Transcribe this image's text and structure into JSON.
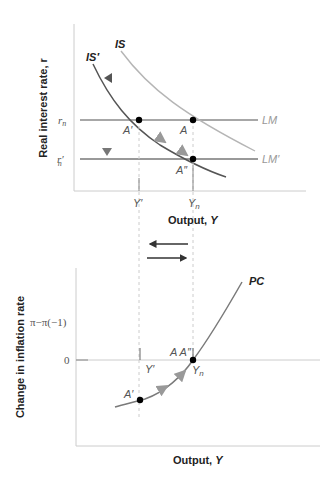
{
  "top_panel": {
    "ylabel": "Real interest rate, r",
    "xlabel_text": "Output, ",
    "xlabel_var": "Y",
    "curves": {
      "is": "IS",
      "is_prime": "IS′",
      "lm": "LM",
      "lm_prime": "LM′"
    },
    "y_ticks": {
      "rn": "r",
      "rn_sub": "n",
      "rn_prime": "r′",
      "rn_prime_sub": "n"
    },
    "x_ticks": {
      "y_prime": "Y′",
      "yn": "Y",
      "yn_sub": "n"
    },
    "points": {
      "a_prime": "A′",
      "a": "A",
      "a_dprime": "A″"
    }
  },
  "bottom_panel": {
    "ylabel": "Change in inflation rate",
    "xlabel_text": "Output, ",
    "xlabel_var": "Y",
    "curves": {
      "pc": "PC"
    },
    "y_ticks": {
      "pi": "π−π(−1)",
      "zero": "0"
    },
    "x_ticks": {
      "y_prime": "Y′",
      "yn": "Y",
      "yn_sub": "n"
    },
    "points": {
      "a_prime": "A′",
      "a_a_dprime": "A A″"
    }
  },
  "colors": {
    "is": "#b5b5b5",
    "is_prime": "#555555",
    "lm": "#8a8a8a",
    "pc": "#7a7a7a",
    "axis": "#cccccc",
    "point": "#000000",
    "arrow": "#444444"
  }
}
